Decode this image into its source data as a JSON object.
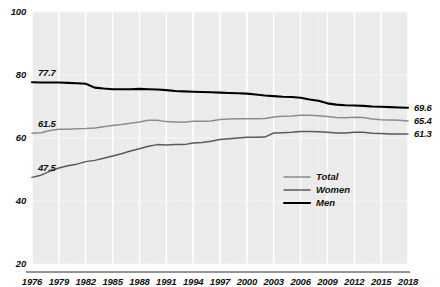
{
  "chart_data": {
    "type": "line",
    "title": "",
    "xlabel": "",
    "ylabel": "",
    "xlim": [
      1976,
      2018
    ],
    "ylim": [
      20,
      100
    ],
    "grid": true,
    "legend_position": "inside-bottom-right",
    "y_ticks": [
      "20",
      "40",
      "60",
      "80",
      "100"
    ],
    "y_tick_values": [
      20,
      40,
      60,
      80,
      100
    ],
    "x_ticks": [
      "1976",
      "1979",
      "1982",
      "1985",
      "1988",
      "1991",
      "1994",
      "1997",
      "2000",
      "2003",
      "2006",
      "2009",
      "2012",
      "2015",
      "2018"
    ],
    "x_tick_values": [
      1976,
      1979,
      1982,
      1985,
      1988,
      1991,
      1994,
      1997,
      2000,
      2003,
      2006,
      2009,
      2012,
      2015,
      2018
    ],
    "x": [
      1976,
      1977,
      1978,
      1979,
      1980,
      1981,
      1982,
      1983,
      1984,
      1985,
      1986,
      1987,
      1988,
      1989,
      1990,
      1991,
      1992,
      1993,
      1994,
      1995,
      1996,
      1997,
      1998,
      1999,
      2000,
      2001,
      2002,
      2003,
      2004,
      2005,
      2006,
      2007,
      2008,
      2009,
      2010,
      2011,
      2012,
      2013,
      2014,
      2015,
      2016,
      2017,
      2018
    ],
    "series": [
      {
        "name": "Total",
        "color": "#8c8c8c",
        "start_label": "61.5",
        "end_label": "65.4",
        "values": [
          61.5,
          61.7,
          62.4,
          62.8,
          62.8,
          62.9,
          63.0,
          63.2,
          63.6,
          64.0,
          64.3,
          64.7,
          65.1,
          65.6,
          65.6,
          65.2,
          65.1,
          65.0,
          65.3,
          65.3,
          65.4,
          65.9,
          66.0,
          66.1,
          66.1,
          66.1,
          66.2,
          66.7,
          66.9,
          67.0,
          67.2,
          67.2,
          67.1,
          66.8,
          66.5,
          66.4,
          66.6,
          66.5,
          66.0,
          65.8,
          65.7,
          65.6,
          65.4
        ]
      },
      {
        "name": "Women",
        "color": "#5a5a5a",
        "start_label": "47.5",
        "end_label": "61.3",
        "values": [
          47.5,
          48.2,
          49.4,
          50.5,
          51.2,
          51.7,
          52.5,
          52.9,
          53.6,
          54.3,
          55.0,
          55.9,
          56.6,
          57.4,
          57.9,
          57.8,
          57.9,
          57.9,
          58.4,
          58.6,
          59.0,
          59.5,
          59.8,
          60.0,
          60.2,
          60.2,
          60.3,
          61.6,
          61.7,
          61.8,
          62.1,
          62.1,
          62.0,
          61.8,
          61.6,
          61.6,
          61.8,
          61.8,
          61.5,
          61.4,
          61.3,
          61.3,
          61.3
        ]
      },
      {
        "name": "Men",
        "color": "#000000",
        "start_label": "77.7",
        "end_label": "69.6",
        "values": [
          77.7,
          77.6,
          77.6,
          77.6,
          77.5,
          77.4,
          77.2,
          76.0,
          75.7,
          75.5,
          75.5,
          75.5,
          75.6,
          75.5,
          75.4,
          75.2,
          74.9,
          74.8,
          74.7,
          74.6,
          74.5,
          74.4,
          74.3,
          74.2,
          74.1,
          73.8,
          73.5,
          73.3,
          73.1,
          73.0,
          72.8,
          72.2,
          71.8,
          71.0,
          70.6,
          70.4,
          70.3,
          70.2,
          70.0,
          69.9,
          69.8,
          69.7,
          69.6
        ]
      }
    ]
  },
  "legend": {
    "items": [
      {
        "label": "Total",
        "color": "#8c8c8c"
      },
      {
        "label": "Women",
        "color": "#5a5a5a"
      },
      {
        "label": "Men",
        "color": "#000000"
      }
    ]
  },
  "plot": {
    "background_color": "#ebebeb",
    "gridline_color": "#ffffff",
    "axis_color": "#2a2a2a"
  }
}
